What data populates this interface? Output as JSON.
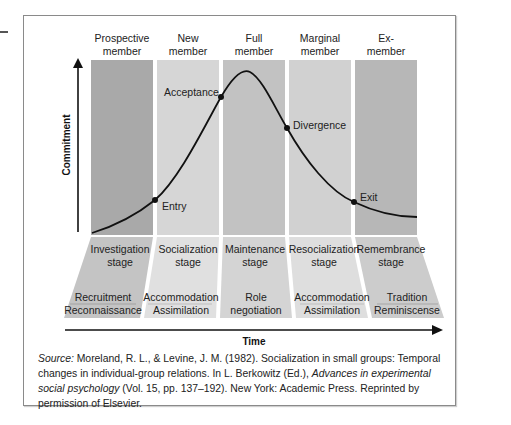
{
  "figure": {
    "columns": [
      {
        "header_line1": "Prospective",
        "header_line2": "member",
        "stage_line1": "Investigation",
        "stage_line2": "stage",
        "process_line1": "Recruitment",
        "process_line2": "Reconnaissance",
        "color": "#a9a9a9",
        "band_color": "#c4c4c4"
      },
      {
        "header_line1": "New",
        "header_line2": "member",
        "stage_line1": "Socialization",
        "stage_line2": "stage",
        "process_line1": "Accommodation",
        "process_line2": "Assimilation",
        "color": "#d6d6d6",
        "band_color": "#e0e0e0"
      },
      {
        "header_line1": "Full",
        "header_line2": "member",
        "stage_line1": "Maintenance",
        "stage_line2": "stage",
        "process_line1": "Role",
        "process_line2": "negotiation",
        "color": "#c2c2c2",
        "band_color": "#d4d4d4"
      },
      {
        "header_line1": "Marginal",
        "header_line2": "member",
        "stage_line1": "Resocialization",
        "stage_line2": "stage",
        "process_line1": "Accommodation",
        "process_line2": "Assimilation",
        "color": "#d1d1d1",
        "band_color": "#dedede"
      },
      {
        "header_line1": "Ex-",
        "header_line2": "member",
        "stage_line1": "Remembrance",
        "stage_line2": "stage",
        "process_line1": "Tradition",
        "process_line2": "Reminiscense",
        "color": "#b7b7b7",
        "band_color": "#cccccc"
      }
    ],
    "y_axis_label": "Commitment",
    "x_axis_label": "Time",
    "transition_points": [
      {
        "label": "Entry"
      },
      {
        "label": "Acceptance"
      },
      {
        "label": "Divergence"
      },
      {
        "label": "Exit"
      }
    ]
  },
  "caption": {
    "source_label": "Source:",
    "text_part1": " Moreland, R. L., & Levine, J. M. (1982). Socialization in small groups: Temporal changes in individual-group relations. In L. Berkowitz (Ed.), ",
    "italic_title": "Advances in experimental social psychology",
    "text_part2": " (Vol. 15, pp. 137–192). New York: Academic Press. Reprinted by permission of Elsevier."
  }
}
